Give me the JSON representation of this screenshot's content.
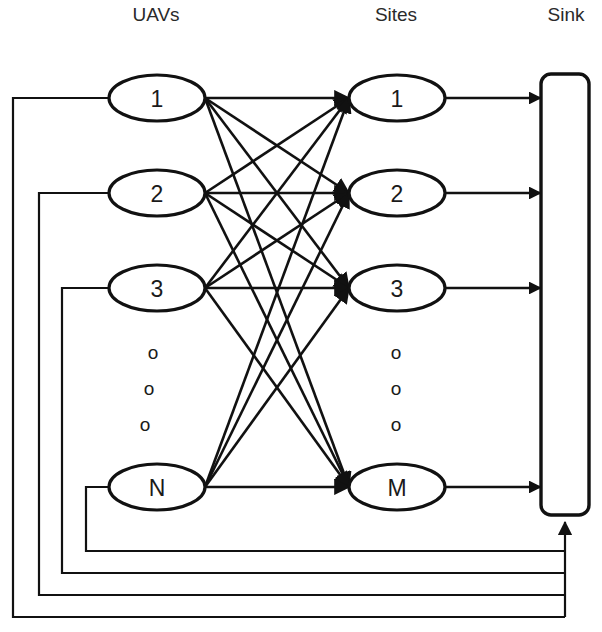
{
  "diagram": {
    "background_color": "#ffffff",
    "line_color": "#111111",
    "columns": [
      {
        "id": "uavs",
        "label": "UAVs",
        "x": 156,
        "y": 16
      },
      {
        "id": "sites",
        "label": "Sites",
        "x": 396,
        "y": 16
      },
      {
        "id": "sink",
        "label": "Sink",
        "x": 566,
        "y": 16
      }
    ],
    "uav_nodes": [
      {
        "id": "uav-1",
        "label": "1",
        "cx": 157,
        "cy": 98,
        "rx": 48,
        "ry": 23
      },
      {
        "id": "uav-2",
        "label": "2",
        "cx": 157,
        "cy": 193,
        "rx": 48,
        "ry": 23
      },
      {
        "id": "uav-3",
        "label": "3",
        "cx": 157,
        "cy": 288,
        "rx": 48,
        "ry": 23
      },
      {
        "id": "uav-n",
        "label": "N",
        "cx": 157,
        "cy": 487,
        "rx": 48,
        "ry": 23
      }
    ],
    "site_nodes": [
      {
        "id": "site-1",
        "label": "1",
        "cx": 397,
        "cy": 98,
        "rx": 48,
        "ry": 23
      },
      {
        "id": "site-2",
        "label": "2",
        "cx": 397,
        "cy": 193,
        "rx": 48,
        "ry": 23
      },
      {
        "id": "site-3",
        "label": "3",
        "cx": 397,
        "cy": 288,
        "rx": 48,
        "ry": 23
      },
      {
        "id": "site-m",
        "label": "M",
        "cx": 397,
        "cy": 487,
        "rx": 48,
        "ry": 23
      }
    ],
    "uav_ellipsis": {
      "glyph": "o",
      "dots": [
        {
          "x": 153,
          "y": 352
        },
        {
          "x": 149,
          "y": 388
        },
        {
          "x": 145,
          "y": 424
        }
      ]
    },
    "site_ellipsis": {
      "glyph": "o",
      "dots": [
        {
          "x": 396,
          "y": 352
        },
        {
          "x": 396,
          "y": 388
        },
        {
          "x": 396,
          "y": 424
        }
      ]
    },
    "sink": {
      "id": "sink-bar",
      "x": 541,
      "y": 74,
      "width": 48,
      "height": 441,
      "corner_radius": 10
    },
    "bipartite_edges": [
      {
        "from": "uav-1",
        "to": "site-1"
      },
      {
        "from": "uav-1",
        "to": "site-2"
      },
      {
        "from": "uav-1",
        "to": "site-3"
      },
      {
        "from": "uav-1",
        "to": "site-m"
      },
      {
        "from": "uav-2",
        "to": "site-1"
      },
      {
        "from": "uav-2",
        "to": "site-2"
      },
      {
        "from": "uav-2",
        "to": "site-3"
      },
      {
        "from": "uav-2",
        "to": "site-m"
      },
      {
        "from": "uav-3",
        "to": "site-1"
      },
      {
        "from": "uav-3",
        "to": "site-2"
      },
      {
        "from": "uav-3",
        "to": "site-3"
      },
      {
        "from": "uav-3",
        "to": "site-m"
      },
      {
        "from": "uav-n",
        "to": "site-1"
      },
      {
        "from": "uav-n",
        "to": "site-2"
      },
      {
        "from": "uav-n",
        "to": "site-3"
      },
      {
        "from": "uav-n",
        "to": "site-m"
      }
    ],
    "sink_edges": [
      {
        "from": "site-1",
        "to": "sink-bar",
        "y": 98
      },
      {
        "from": "site-2",
        "to": "sink-bar",
        "y": 193
      },
      {
        "from": "site-3",
        "to": "sink-bar",
        "y": 288
      },
      {
        "from": "site-m",
        "to": "sink-bar",
        "y": 487
      }
    ],
    "feedback_edges": [
      {
        "to": "uav-1",
        "entry_y": 98,
        "left_x": 13,
        "bottom_y": 617
      },
      {
        "to": "uav-2",
        "entry_y": 193,
        "left_x": 39,
        "bottom_y": 595
      },
      {
        "to": "uav-3",
        "entry_y": 288,
        "left_x": 62,
        "bottom_y": 573
      },
      {
        "to": "uav-n",
        "entry_y": 487,
        "left_x": 86,
        "bottom_y": 551
      }
    ],
    "feedback_riser": {
      "x": 565,
      "top_y": 522,
      "bottom_y": 617
    }
  }
}
